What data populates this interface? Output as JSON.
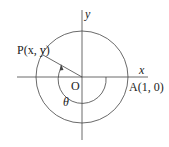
{
  "diagram": {
    "labels": {
      "x_axis": "x",
      "y_axis": "y",
      "origin": "O",
      "point_p": "P(x, y)",
      "point_a": "A(1, 0)",
      "angle": "θ"
    },
    "colors": {
      "stroke": "#333333",
      "text": "#222222"
    }
  }
}
